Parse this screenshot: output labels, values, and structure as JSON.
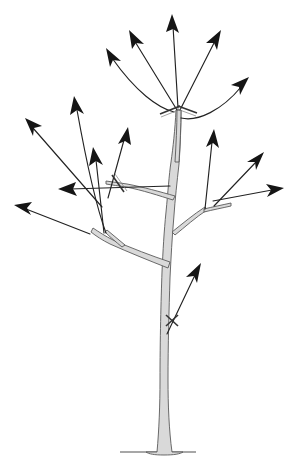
{
  "figure": {
    "type": "line-art-diagram",
    "background_color": "#ffffff",
    "canvas": {
      "width": 293,
      "height": 463
    }
  },
  "colors": {
    "branch_fill": "#d9d9d9",
    "branch_stroke": "#5a5a5a",
    "arrow_stroke": "#222222",
    "arrow_head_fill": "#151515",
    "cut_mark_stroke": "#333333",
    "ground_stroke": "#8a8a8a"
  },
  "ground": {
    "label": "ground-line",
    "x1": 120,
    "y1": 452,
    "x2": 196,
    "y2": 452
  },
  "trunk": {
    "label": "main-trunk",
    "base_x": 163,
    "base_y": 452,
    "top_x": 178,
    "top_y": 108,
    "description": "central leader rising from flared base to top crotch"
  },
  "branches": [
    {
      "name": "branch-left-main",
      "from": [
        164,
        260
      ],
      "to": [
        92,
        230
      ],
      "description": "large lower-left scaffold limb"
    },
    {
      "name": "branch-left-lower-sub",
      "from": [
        118,
        243
      ],
      "to": [
        104,
        232
      ],
      "description": "short sub-branch off lower-left limb"
    },
    {
      "name": "branch-left-upper",
      "from": [
        170,
        185
      ],
      "to": [
        108,
        183
      ],
      "description": "upper-left scaffold limb toward cut mark"
    },
    {
      "name": "branch-right-main",
      "from": [
        173,
        225
      ],
      "to": [
        213,
        205
      ],
      "description": "lower-right scaffold limb"
    },
    {
      "name": "branch-right-spur",
      "from": [
        205,
        208
      ],
      "to": [
        230,
        203
      ],
      "description": "right spur off lower-right limb"
    },
    {
      "name": "branch-central-leader",
      "from": [
        178,
        160
      ],
      "to": [
        178,
        108
      ],
      "description": "central leader section above upper crotch"
    }
  ],
  "arrows": [
    {
      "name": "arrow-top-center",
      "tail": [
        178,
        108
      ],
      "head": [
        172,
        16
      ],
      "direction": "up"
    },
    {
      "name": "arrow-upper-left-inner",
      "tail": [
        178,
        108
      ],
      "head": [
        130,
        30
      ],
      "direction": "up-left"
    },
    {
      "name": "arrow-upper-left-curved",
      "tail": [
        172,
        110
      ],
      "head": [
        107,
        48
      ],
      "direction": "up-left",
      "curved": true
    },
    {
      "name": "arrow-upper-right-inner",
      "tail": [
        180,
        110
      ],
      "head": [
        219,
        31
      ],
      "direction": "up-right"
    },
    {
      "name": "arrow-upper-right-outer",
      "tail": [
        182,
        115
      ],
      "head": [
        247,
        78
      ],
      "direction": "up-right",
      "curved": true
    },
    {
      "name": "arrow-mid-left-tall",
      "tail": [
        104,
        232
      ],
      "head": [
        74,
        97
      ],
      "direction": "up",
      "curved": true
    },
    {
      "name": "arrow-mid-left-outer",
      "tail": [
        100,
        205
      ],
      "head": [
        25,
        118
      ],
      "direction": "up-left"
    },
    {
      "name": "arrow-left-short-up",
      "tail": [
        104,
        232
      ],
      "head": [
        92,
        148
      ],
      "direction": "up"
    },
    {
      "name": "arrow-left-diagonal-up",
      "tail": [
        108,
        196
      ],
      "head": [
        126,
        128
      ],
      "direction": "up-right"
    },
    {
      "name": "arrow-left-horizontal",
      "tail": [
        170,
        185
      ],
      "head": [
        60,
        188
      ],
      "direction": "left"
    },
    {
      "name": "arrow-far-left-low",
      "tail": [
        85,
        232
      ],
      "head": [
        16,
        205
      ],
      "direction": "left-up"
    },
    {
      "name": "arrow-right-vertical",
      "tail": [
        205,
        208
      ],
      "head": [
        214,
        130
      ],
      "direction": "up"
    },
    {
      "name": "arrow-right-horizontal",
      "tail": [
        213,
        200
      ],
      "head": [
        283,
        188
      ],
      "direction": "right"
    },
    {
      "name": "arrow-right-upper-diagonal",
      "tail": [
        213,
        205
      ],
      "head": [
        263,
        152
      ],
      "direction": "up-right"
    },
    {
      "name": "arrow-trunk-lower",
      "tail": [
        168,
        333
      ],
      "head": [
        200,
        264
      ],
      "direction": "up-right"
    }
  ],
  "cut_marks": [
    {
      "name": "cut-mark-top-left",
      "x": 170,
      "y": 110,
      "note": "double slash across left upper branch"
    },
    {
      "name": "cut-mark-top-right",
      "x": 186,
      "y": 110,
      "note": "double slash across right upper branch"
    },
    {
      "name": "cut-mark-upper-left-branch",
      "x": 118,
      "y": 183,
      "note": "double slash across upper-left scaffold"
    },
    {
      "name": "cut-mark-trunk",
      "x": 172,
      "y": 320,
      "note": "small cross on lower trunk sprout"
    }
  ],
  "legend": {
    "arrow_meaning": "direction of shoot growth",
    "cut_mark_meaning": "pruning cut location"
  }
}
